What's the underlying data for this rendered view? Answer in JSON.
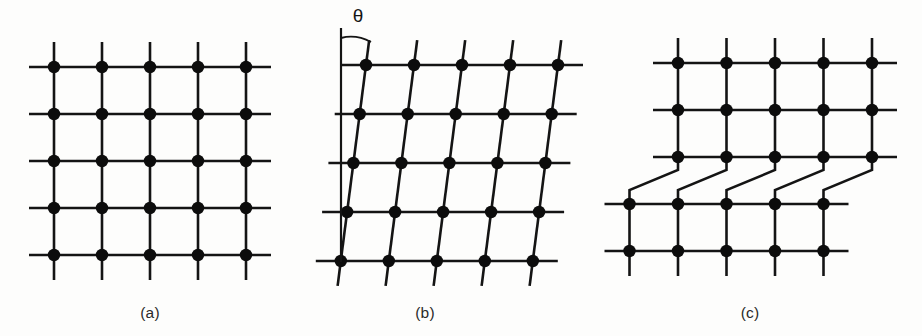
{
  "figure": {
    "background_color": "#fdfdfc",
    "line_color": "#141414",
    "node_color": "#0c0c0c",
    "width": 922,
    "height": 336
  },
  "panels": [
    {
      "id": "panel-a",
      "caption": "(a)",
      "caption_x": 150,
      "caption_y": 318,
      "description": "perfect square lattice",
      "type": "square",
      "rows": 5,
      "cols": 5,
      "origin_x": 54,
      "origin_y": 67,
      "spacing_x": 48,
      "spacing_y": 47,
      "overhang": 25,
      "shear_per_row": 0,
      "node_radius": 6.2
    },
    {
      "id": "panel-b",
      "caption": "(b)",
      "caption_x": 425,
      "caption_y": 318,
      "description": "sheared lattice tilted by angle theta",
      "type": "sheared",
      "rows": 5,
      "cols": 5,
      "origin_x": 366,
      "origin_y": 65,
      "spacing_x": 48,
      "spacing_y": 49,
      "overhang": 25,
      "shear_per_row": -6.3,
      "node_radius": 6.2,
      "angle_label": "θ",
      "angle_label_x": 358,
      "angle_label_y": 22,
      "reference_line_x": 341,
      "reference_line_top": 28,
      "reference_line_bottom": 262,
      "arc_start_x": 341,
      "arc_start_y": 38,
      "arc_end_x": 371,
      "arc_end_y": 42
    },
    {
      "id": "panel-c",
      "caption": "(c)",
      "caption_x": 750,
      "caption_y": 318,
      "description": "lattice with slip step and edge dislocation jog",
      "type": "jogged",
      "rows_top": 3,
      "rows_bottom": 2,
      "cols": 5,
      "origin_x": 678,
      "origin_y": 63,
      "spacing_x": 48.5,
      "spacing_y": 47,
      "overhang": 25,
      "node_radius": 6.2,
      "jog_offset_x": -48.5,
      "jog_row_index": 2,
      "jog_drop_before": 13,
      "jog_diagonal_height": 20,
      "extra_halfplane_col": 5
    }
  ]
}
